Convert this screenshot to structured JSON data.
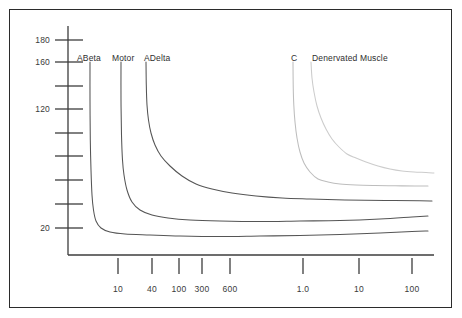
{
  "figure": {
    "background_color": "#ffffff",
    "frame_color": "#2b2b2b"
  },
  "chart_data": {
    "type": "line",
    "title": "",
    "subtitle": "",
    "xlabel": "",
    "ylabel": "",
    "grid": false,
    "legend_position": "inline-curve-labels",
    "x_axis": {
      "scale": "log-segmented",
      "tick_labels": [
        "10",
        "40",
        "100",
        "300",
        "600",
        "1.0",
        "10",
        "100"
      ],
      "tick_pixel_x": [
        118,
        152,
        179,
        202,
        230,
        303,
        359,
        412
      ],
      "units_note": "left segment microseconds, right segment milliseconds"
    },
    "y_axis": {
      "scale": "linear",
      "tick_labels": [
        "180",
        "",
        "160",
        "",
        "120",
        "",
        "",
        "",
        "",
        "20"
      ],
      "labeled_ticks": [
        "180",
        "160",
        "120",
        "20"
      ],
      "labeled_tick_values": [
        180,
        160,
        120,
        20
      ],
      "labeled_tick_pixel_y": [
        40,
        62,
        109,
        228
      ],
      "minor_tick_pixel_y": [
        40,
        62,
        86,
        109,
        133,
        156,
        180,
        204,
        228
      ],
      "ylim": [
        0,
        190
      ]
    },
    "series": [
      {
        "name": "ABeta",
        "label": "ABeta",
        "color": "#555555",
        "label_pixel": {
          "x": 77,
          "y": 53
        },
        "points_pixel": [
          [
            90,
            62
          ],
          [
            90,
            100
          ],
          [
            90.3,
            140
          ],
          [
            91,
            170
          ],
          [
            92,
            195
          ],
          [
            93.5,
            210
          ],
          [
            96,
            221
          ],
          [
            101,
            228
          ],
          [
            110,
            232
          ],
          [
            125,
            234
          ],
          [
            150,
            235
          ],
          [
            180,
            236
          ],
          [
            220,
            236.5
          ],
          [
            260,
            236
          ],
          [
            300,
            235.5
          ],
          [
            340,
            234.5
          ],
          [
            380,
            233
          ],
          [
            412,
            231.5
          ],
          [
            428,
            231
          ]
        ]
      },
      {
        "name": "Motor",
        "label": "Motor",
        "color": "#555555",
        "label_pixel": {
          "x": 112,
          "y": 53
        },
        "points_pixel": [
          [
            121,
            62
          ],
          [
            121,
            100
          ],
          [
            121.5,
            135
          ],
          [
            122.5,
            160
          ],
          [
            124,
            175
          ],
          [
            127,
            190
          ],
          [
            132,
            202
          ],
          [
            140,
            210
          ],
          [
            152,
            215
          ],
          [
            168,
            218
          ],
          [
            190,
            220
          ],
          [
            220,
            221
          ],
          [
            260,
            221.5
          ],
          [
            300,
            221
          ],
          [
            340,
            220.5
          ],
          [
            380,
            219
          ],
          [
            412,
            217
          ],
          [
            428,
            216
          ]
        ]
      },
      {
        "name": "ADelta",
        "label": "ADelta",
        "color": "#555555",
        "label_pixel": {
          "x": 144,
          "y": 53
        },
        "points_pixel": [
          [
            146,
            62
          ],
          [
            146.3,
            85
          ],
          [
            147,
            105
          ],
          [
            148.5,
            120
          ],
          [
            151,
            133
          ],
          [
            155,
            145
          ],
          [
            161,
            156
          ],
          [
            170,
            166
          ],
          [
            182,
            176
          ],
          [
            196,
            184
          ],
          [
            212,
            189
          ],
          [
            232,
            193
          ],
          [
            256,
            196
          ],
          [
            282,
            198
          ],
          [
            310,
            199
          ],
          [
            345,
            200
          ],
          [
            385,
            200.5
          ],
          [
            420,
            200.8
          ],
          [
            432,
            201
          ]
        ]
      },
      {
        "name": "C",
        "label": "C",
        "color": "#bdbdbd",
        "label_pixel": {
          "x": 291,
          "y": 53
        },
        "points_pixel": [
          [
            293,
            62
          ],
          [
            293.2,
            85
          ],
          [
            293.8,
            105
          ],
          [
            295,
            122
          ],
          [
            297,
            138
          ],
          [
            300,
            152
          ],
          [
            304,
            163
          ],
          [
            310,
            172
          ],
          [
            318,
            179
          ],
          [
            328,
            182
          ],
          [
            340,
            184
          ],
          [
            356,
            185
          ],
          [
            375,
            185.5
          ],
          [
            395,
            185.8
          ],
          [
            415,
            186
          ],
          [
            428,
            186
          ]
        ]
      },
      {
        "name": "Denervated Muscle",
        "label": "Denervated Muscle",
        "color": "#cccccc",
        "label_pixel": {
          "x": 312,
          "y": 53
        },
        "points_pixel": [
          [
            311,
            62
          ],
          [
            312,
            78
          ],
          [
            314,
            92
          ],
          [
            317,
            106
          ],
          [
            321,
            118
          ],
          [
            326,
            129
          ],
          [
            332,
            139
          ],
          [
            339,
            147
          ],
          [
            347,
            154
          ],
          [
            356,
            158
          ],
          [
            366,
            162
          ],
          [
            378,
            166
          ],
          [
            390,
            169
          ],
          [
            402,
            171
          ],
          [
            414,
            172
          ],
          [
            426,
            172.5
          ],
          [
            434,
            173
          ]
        ]
      }
    ],
    "annotations": [
      {
        "text": "ABeta",
        "x_pixel": 77,
        "y_pixel": 53
      },
      {
        "text": "Motor",
        "x_pixel": 112,
        "y_pixel": 53
      },
      {
        "text": "ADelta",
        "x_pixel": 144,
        "y_pixel": 53
      },
      {
        "text": "C",
        "x_pixel": 291,
        "y_pixel": 53
      },
      {
        "text": "Denervated Muscle",
        "x_pixel": 312,
        "y_pixel": 53
      }
    ],
    "axes_geometry": {
      "y_axis_x_pixel": 68,
      "y_axis_top_pixel": 26,
      "y_axis_bottom_pixel": 255,
      "x_axis_y_pixel": 255,
      "x_axis_left_pixel": 68,
      "x_axis_right_pixel": 434,
      "y_tick_left_pixel": 55,
      "y_tick_right_pixel": 83,
      "x_tick_top_pixel": 258,
      "x_tick_bottom_pixel": 274,
      "x_tick_label_y_pixel": 284
    }
  }
}
